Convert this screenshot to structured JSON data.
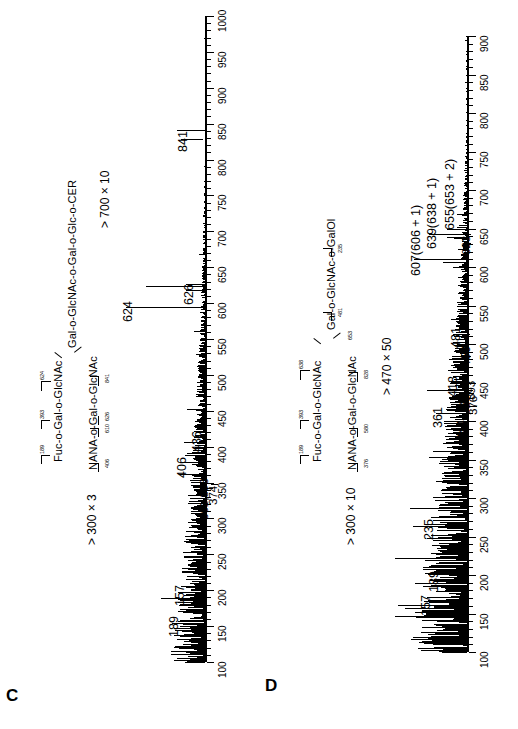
{
  "figure": {
    "panels": [
      {
        "letter": "C",
        "structure": {
          "core_chain": "Gal-o-GlcNAc-o-Gal-o-Glc-o-CER",
          "upper_branch": "Fuc-o-Gal-o-GlcNAc",
          "lower_branch": "NANA-o-Gal-o-GlcNAc",
          "upper_cleavages": [
            "189",
            "393",
            "624"
          ],
          "lower_cleavages": [
            "406",
            "610",
            "626",
            "841"
          ]
        },
        "scale_note": "> 300 × 3",
        "scale_note_2": "> 700 × 10",
        "axis": {
          "label_min": "100",
          "label_max": "1000",
          "ticks": [
            "100",
            "150",
            "200",
            "250",
            "300",
            "350",
            "400",
            "450",
            "500",
            "550",
            "600",
            "650",
            "700",
            "750",
            "800",
            "850",
            "900",
            "950",
            "1000"
          ]
        },
        "peak_labels": [
          "157",
          "189",
          "361,393",
          "374",
          "406",
          "436",
          "624",
          "626",
          "841"
        ],
        "chart_data": {
          "type": "line",
          "title": "FAB-MS spectrum C",
          "xlabel": "m/z",
          "ylabel": "Relative intensity",
          "xlim": [
            100,
            1000
          ],
          "ylim": [
            0,
            100
          ],
          "grid": false,
          "legend": "none",
          "annotations": [
            "> 300 × 3",
            "> 700 × 10"
          ],
          "labelled_peaks": [
            {
              "mz": 157,
              "intensity": 28
            },
            {
              "mz": 189,
              "intensity": 46
            },
            {
              "mz": 361,
              "intensity": 14
            },
            {
              "mz": 374,
              "intensity": 9
            },
            {
              "mz": 393,
              "intensity": 12
            },
            {
              "mz": 406,
              "intensity": 22
            },
            {
              "mz": 436,
              "intensity": 11
            },
            {
              "mz": 624,
              "intensity": 62
            },
            {
              "mz": 626,
              "intensity": 20
            },
            {
              "mz": 841,
              "intensity": 30
            }
          ]
        }
      },
      {
        "letter": "D",
        "structure": {
          "core_chain": "Gal-o-GlcNAc-o-GalOl",
          "upper_branch": "Fuc-o-Gal-o-GlcNAc",
          "lower_branch": "NANA-o-Gal-o-GlcNAc",
          "upper_cleavages": [
            "189",
            "393",
            "638"
          ],
          "lower_cleavages": [
            "376",
            "580",
            "828",
            "653"
          ],
          "core_cleavages": [
            "481",
            "235"
          ]
        },
        "scale_note": "> 300 × 10",
        "scale_note_2": "> 470 × 50",
        "axis": {
          "label_min": "100",
          "label_max": "900",
          "ticks": [
            "100",
            "150",
            "200",
            "250",
            "300",
            "350",
            "400",
            "450",
            "500",
            "550",
            "600",
            "650",
            "700",
            "750",
            "800",
            "850",
            "900"
          ]
        },
        "peak_labels": [
          "157",
          "189",
          "235",
          "344",
          "361",
          "376",
          "386",
          "393",
          "418",
          "450",
          "481",
          "623",
          "607(606 + 1)",
          "639(638 + 1)",
          "655(653 + 2)"
        ],
        "chart_data": {
          "type": "line",
          "title": "FAB-MS spectrum D",
          "xlabel": "m/z",
          "ylabel": "Relative intensity",
          "xlim": [
            100,
            900
          ],
          "ylim": [
            0,
            100
          ],
          "grid": false,
          "legend": "none",
          "annotations": [
            "> 300 × 10",
            "> 470 × 50"
          ],
          "labelled_peaks": [
            {
              "mz": 157,
              "intensity": 62
            },
            {
              "mz": 189,
              "intensity": 52
            },
            {
              "mz": 235,
              "intensity": 30
            },
            {
              "mz": 344,
              "intensity": 12
            },
            {
              "mz": 361,
              "intensity": 34
            },
            {
              "mz": 376,
              "intensity": 10
            },
            {
              "mz": 386,
              "intensity": 14
            },
            {
              "mz": 393,
              "intensity": 11
            },
            {
              "mz": 418,
              "intensity": 20
            },
            {
              "mz": 450,
              "intensity": 12
            },
            {
              "mz": 481,
              "intensity": 18
            },
            {
              "mz": 607,
              "intensity": 24
            },
            {
              "mz": 623,
              "intensity": 9
            },
            {
              "mz": 639,
              "intensity": 20
            },
            {
              "mz": 655,
              "intensity": 8
            }
          ]
        }
      }
    ]
  }
}
